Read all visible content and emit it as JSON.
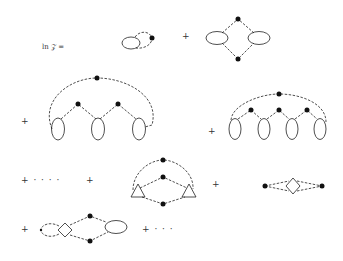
{
  "label": {
    "text": "ln 𝒵 ="
  },
  "operators": {
    "plus": "+",
    "plus_ellipsis": "+ · · · ·",
    "plus_ellipsis_end": "+ · · ·"
  },
  "diagrams": [
    {
      "id": "d1",
      "description": "single loop with one vertex and a bubble"
    },
    {
      "id": "d2",
      "description": "diamond with two vertices and two bubbles"
    },
    {
      "id": "d3",
      "description": "arc with three bubbles and three vertices"
    },
    {
      "id": "d4",
      "description": "arc with four bubbles and four vertices"
    },
    {
      "id": "d5",
      "description": "two triangles joined by three lines with vertices"
    },
    {
      "id": "d6",
      "description": "two vertices joined through a diamond"
    },
    {
      "id": "d7",
      "description": "diamond, loop, bubble with two vertices"
    }
  ],
  "colors": {
    "ink": "#222222",
    "background": "#ffffff"
  }
}
